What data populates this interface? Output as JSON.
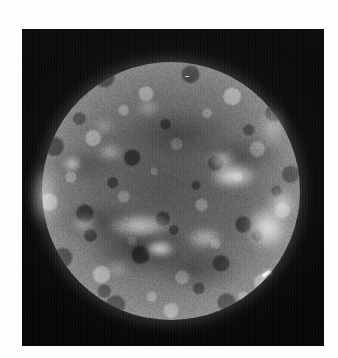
{
  "image": {
    "subject": "Solar disk",
    "modality": "Extreme ultraviolet / soft X-ray full-disk solar image",
    "rendering": "grayscale",
    "alt_text": "Grayscale full-disk image of the Sun showing mottled chromospheric network, bright active regions, limb brightening and a prominence on the western limb",
    "canvas": {
      "width": 338,
      "height": 358
    },
    "border": {
      "style": "white photographic margin",
      "color": "#fdfdfd"
    },
    "frame": {
      "x": 22,
      "y": 29,
      "width": 302,
      "height": 317,
      "background_color": "#050505"
    }
  },
  "colors": {
    "background_white": "#fdfdfd",
    "sky_black": "#050505",
    "disk_midtone": "#7a7a7a",
    "disk_highlight": "#ffffff",
    "disk_shadow": "#3a3a3a",
    "limb_glow": "#aeaeae"
  },
  "disk": {
    "center_x": 171,
    "center_y": 191,
    "diameter": 258,
    "label": "solar-disk",
    "texture": "mottled supergranular network",
    "limb_brightening": true,
    "corona_halo": true
  },
  "features": [
    {
      "name": "active-region-central-east",
      "kind": "plage",
      "x": 233,
      "y": 176,
      "w": 44,
      "h": 22,
      "brightness": 0.96,
      "blur": 4
    },
    {
      "name": "active-region-upper-east",
      "kind": "plage",
      "x": 222,
      "y": 160,
      "w": 26,
      "h": 14,
      "brightness": 0.82,
      "blur": 4
    },
    {
      "name": "bright-point-west-limb",
      "kind": "bright-point",
      "x": 72,
      "y": 164,
      "w": 16,
      "h": 14,
      "brightness": 0.88,
      "blur": 3
    },
    {
      "name": "plage-southwest",
      "kind": "plage",
      "x": 110,
      "y": 152,
      "w": 22,
      "h": 12,
      "brightness": 0.7,
      "blur": 4
    },
    {
      "name": "filament-channel-south",
      "kind": "filament",
      "x": 140,
      "y": 226,
      "w": 62,
      "h": 20,
      "brightness": 0.8,
      "blur": 5
    },
    {
      "name": "plage-south-central",
      "kind": "plage",
      "x": 160,
      "y": 248,
      "w": 28,
      "h": 15,
      "brightness": 0.92,
      "blur": 3
    },
    {
      "name": "plage-southeast",
      "kind": "plage",
      "x": 205,
      "y": 238,
      "w": 34,
      "h": 16,
      "brightness": 0.74,
      "blur": 5
    },
    {
      "name": "limb-prominence-east",
      "kind": "prominence",
      "x": 268,
      "y": 228,
      "w": 40,
      "h": 44,
      "brightness": 0.9,
      "blur": 5
    },
    {
      "name": "coronal-loop-east-limb",
      "kind": "loop",
      "x": 282,
      "y": 204,
      "w": 26,
      "h": 30,
      "brightness": 0.72,
      "blur": 5
    },
    {
      "name": "limb-brightening-west",
      "kind": "limb-glow",
      "x": 44,
      "y": 196,
      "w": 22,
      "h": 60,
      "brightness": 0.62,
      "blur": 6
    },
    {
      "name": "limb-brightening-northeast",
      "kind": "limb-glow",
      "x": 272,
      "y": 128,
      "w": 20,
      "h": 34,
      "brightness": 0.58,
      "blur": 6
    },
    {
      "name": "plage-north-central",
      "kind": "plage",
      "x": 148,
      "y": 108,
      "w": 20,
      "h": 10,
      "brightness": 0.62,
      "blur": 4
    },
    {
      "name": "plage-northwest",
      "kind": "plage",
      "x": 104,
      "y": 126,
      "w": 18,
      "h": 10,
      "brightness": 0.56,
      "blur": 4
    },
    {
      "name": "plage-south-west-edge",
      "kind": "plage",
      "x": 84,
      "y": 224,
      "w": 24,
      "h": 14,
      "brightness": 0.66,
      "blur": 5
    },
    {
      "name": "plage-far-south",
      "kind": "plage",
      "x": 118,
      "y": 268,
      "w": 20,
      "h": 11,
      "brightness": 0.52,
      "blur": 5
    }
  ],
  "artifacts": {
    "cosmic_ray_streak": {
      "name": "bright-streak-artifact",
      "x": 265,
      "y": 274,
      "length": 9,
      "angle_deg": -33
    },
    "detector_speck": {
      "name": "bright-speck-artifact",
      "x": 185,
      "y": 76
    },
    "scan_striping": true,
    "film_grain": true
  }
}
